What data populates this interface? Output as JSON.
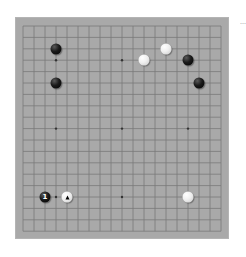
{
  "board": {
    "size": 19,
    "background_color": "#a9a9a9",
    "line_color": "#7a7a7a",
    "star_points": [
      [
        3,
        3
      ],
      [
        9,
        3
      ],
      [
        15,
        3
      ],
      [
        3,
        9
      ],
      [
        9,
        9
      ],
      [
        15,
        9
      ],
      [
        3,
        15
      ],
      [
        9,
        15
      ],
      [
        15,
        15
      ]
    ],
    "stones": [
      {
        "color": "black",
        "col": 3,
        "row": 2,
        "label": ""
      },
      {
        "color": "black",
        "col": 3,
        "row": 5,
        "label": ""
      },
      {
        "color": "white",
        "col": 11,
        "row": 3,
        "label": ""
      },
      {
        "color": "white",
        "col": 13,
        "row": 2,
        "label": ""
      },
      {
        "color": "black",
        "col": 15,
        "row": 3,
        "label": ""
      },
      {
        "color": "black",
        "col": 16,
        "row": 5,
        "label": ""
      },
      {
        "color": "black",
        "col": 2,
        "row": 15,
        "label": "1"
      },
      {
        "color": "white",
        "col": 4,
        "row": 15,
        "label": "",
        "marker": "triangle"
      },
      {
        "color": "white",
        "col": 15,
        "row": 15,
        "label": ""
      }
    ]
  },
  "side_label": "…"
}
